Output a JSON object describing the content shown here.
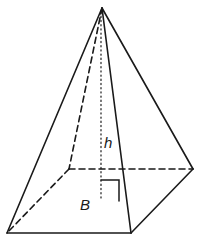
{
  "figure": {
    "type": "square-pyramid",
    "labels": {
      "height": "h",
      "base": "B"
    },
    "colors": {
      "stroke": "#1a1a1a",
      "background": "#ffffff"
    },
    "vertices": {
      "apex": [
        102,
        8
      ],
      "front_left": [
        7,
        233
      ],
      "front_right": [
        131,
        233
      ],
      "back_right": [
        193,
        169
      ],
      "back_left": [
        69,
        169
      ],
      "height_foot": [
        101,
        201
      ]
    }
  }
}
